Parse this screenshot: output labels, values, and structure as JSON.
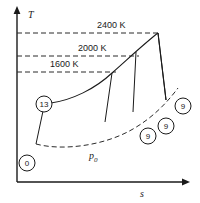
{
  "figure": {
    "type": "temperature-entropy-diagram",
    "background_color": "#ffffff",
    "line_color": "#1a1a1a"
  },
  "axes": {
    "y_label": "T",
    "x_label": "s",
    "y_axis_name": "temperature-axis",
    "x_axis_name": "entropy-axis"
  },
  "isotherms": [
    {
      "label": "2400 K",
      "value": 2400,
      "unit": "K"
    },
    {
      "label": "2000 K",
      "value": 2000,
      "unit": "K"
    },
    {
      "label": "1600 K",
      "value": 1600,
      "unit": "K"
    }
  ],
  "isobar": {
    "label": "p",
    "subscript": "0"
  },
  "callouts": [
    {
      "id": "callout-13",
      "text": "13",
      "position": "left-of-upper-curve"
    },
    {
      "id": "callout-0",
      "text": "0",
      "position": "bottom-left-origin"
    },
    {
      "id": "callout-9a",
      "text": "9",
      "position": "right-upper"
    },
    {
      "id": "callout-9b",
      "text": "9",
      "position": "right-middle"
    },
    {
      "id": "callout-9c",
      "text": "9",
      "position": "right-lower"
    }
  ]
}
